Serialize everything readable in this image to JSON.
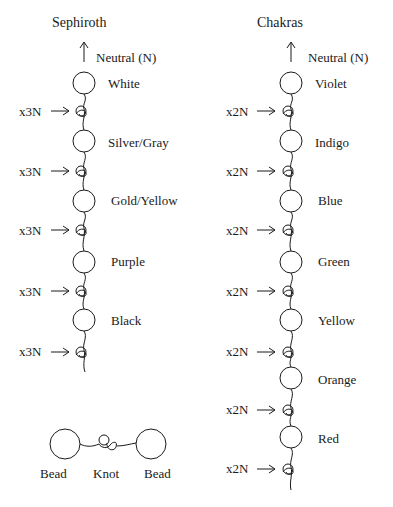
{
  "left": {
    "title": "Sephiroth",
    "neutral_label": "Neutral (N)",
    "beads": [
      "White",
      "Silver/Gray",
      "Gold/Yellow",
      "Purple",
      "Black"
    ],
    "knot_label": "x3N"
  },
  "right": {
    "title": "Chakras",
    "neutral_label": "Neutral (N)",
    "beads": [
      "Violet",
      "Indigo",
      "Blue",
      "Green",
      "Yellow",
      "Orange",
      "Red"
    ],
    "knot_label": "x2N"
  },
  "legend": {
    "bead_left": "Bead",
    "knot": "Knot",
    "bead_right": "Bead"
  },
  "colors": {
    "line": "#1a1a1a",
    "background": "#ffffff"
  }
}
